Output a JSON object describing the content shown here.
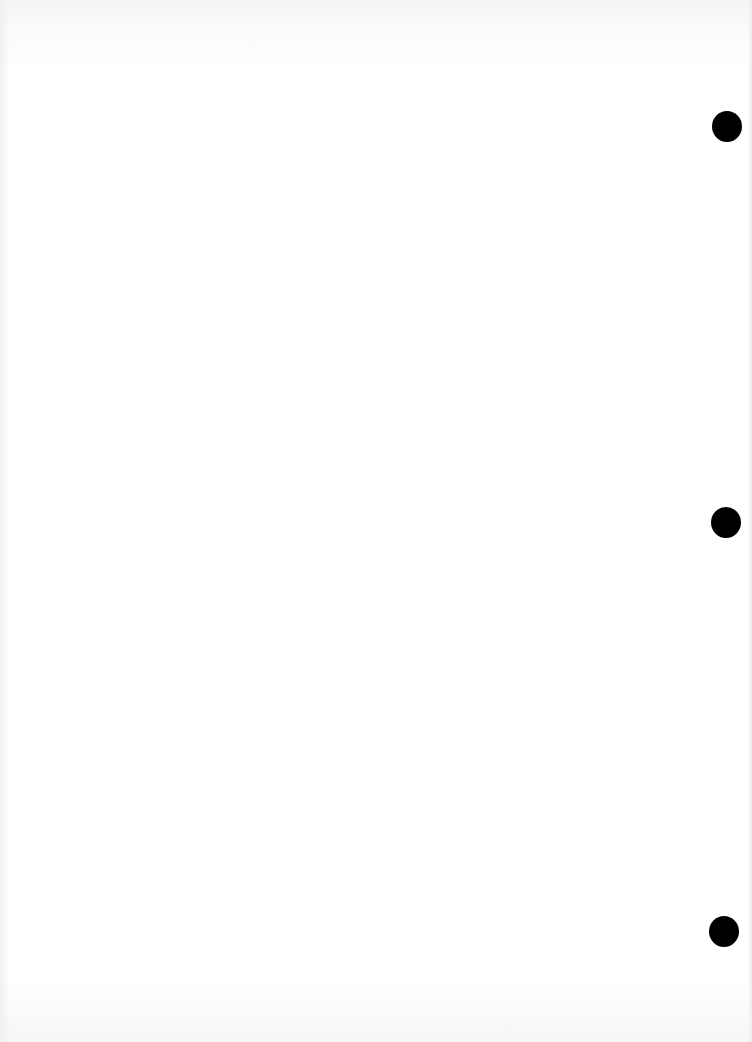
{
  "document": {
    "type": "blank scanned page",
    "text": "",
    "background_color": "#ffffff",
    "punch_holes": [
      {
        "cx": 727,
        "cy": 126,
        "diameter": 30,
        "color": "#000000"
      },
      {
        "cx": 726,
        "cy": 522,
        "diameter": 30,
        "color": "#000000"
      },
      {
        "cx": 724,
        "cy": 931,
        "diameter": 30,
        "color": "#000000"
      }
    ]
  }
}
